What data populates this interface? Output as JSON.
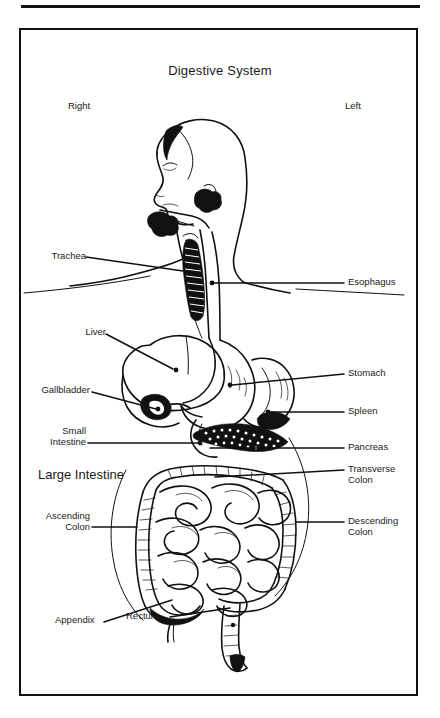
{
  "figure": {
    "title": "Digestive System",
    "orientation": {
      "right_label": "Right",
      "left_label": "Left"
    },
    "border_color": "#111111",
    "background_color": "#ffffff",
    "ink_color": "#111111"
  },
  "labels": {
    "trachea": "Trachea",
    "liver": "Liver",
    "gallbladder": "Gallbladder",
    "small_intestine": "Small\nIntestine",
    "large_intestine": "Large Intestine",
    "ascending_colon": "Ascending\nColon",
    "appendix": "Appendix",
    "rectum": "Rectum",
    "esophagus": "Esophagus",
    "stomach": "Stomach",
    "spleen": "Spleen",
    "pancreas": "Pancreas",
    "transverse_colon": "Transverse\nColon",
    "descending_colon": "Descending\nColon"
  }
}
